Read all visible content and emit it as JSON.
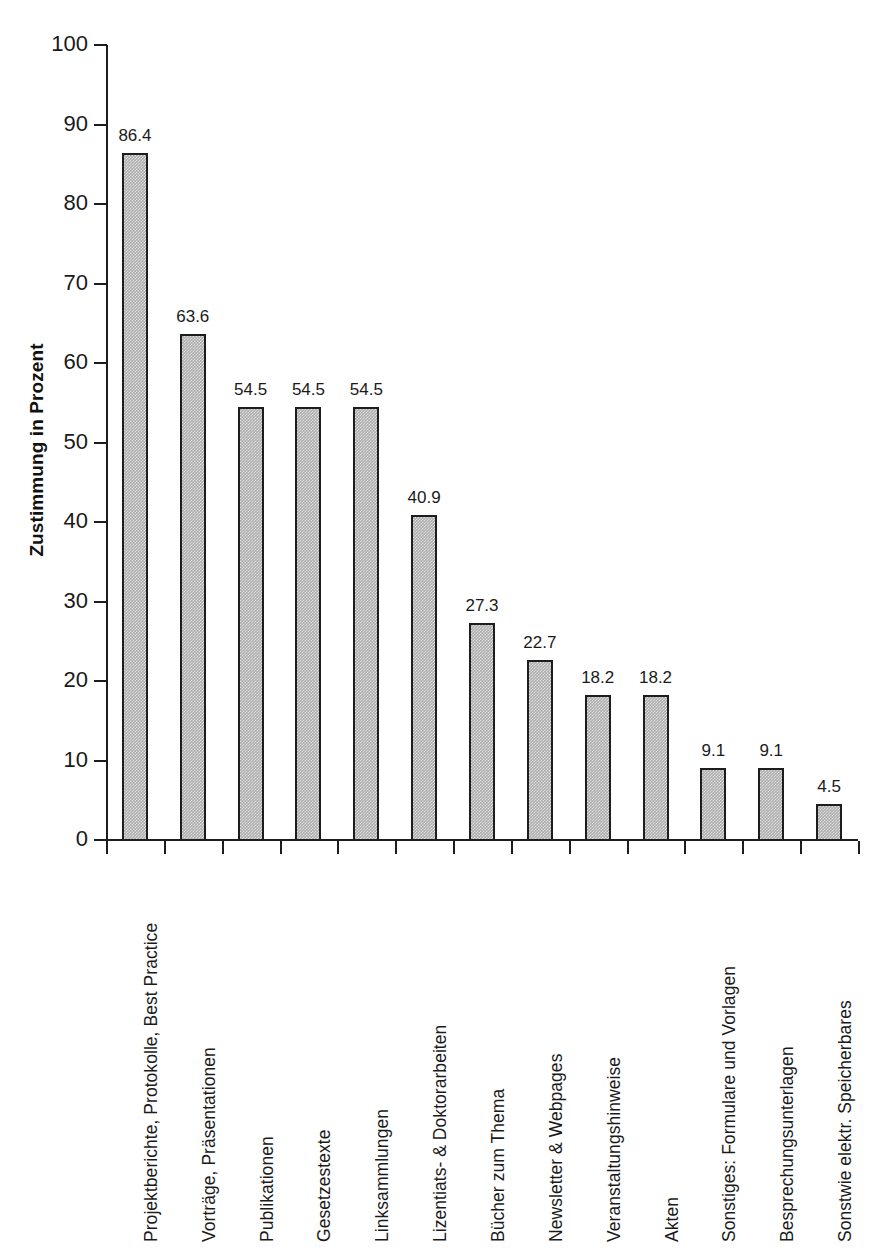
{
  "chart_data": {
    "type": "bar",
    "title": "",
    "subtitle": "",
    "xlabel": "",
    "ylabel": "Zustimmung in Prozent",
    "ylim": [
      0,
      100
    ],
    "ytick_step": 10,
    "yticks": [
      "0",
      "10",
      "20",
      "30",
      "40",
      "50",
      "60",
      "70",
      "80",
      "90",
      "100"
    ],
    "grid": false,
    "legend": false,
    "legend_position": "none",
    "bar_fill_color": "#adadad",
    "bar_border_color": "#1d1d1d",
    "axis_color": "#1d1d1d",
    "value_label_format": "one-decimal",
    "categories": [
      "Projektberichte, Protokolle, Best Practice",
      "Vorträge, Präsentationen",
      "Publikationen",
      "Gesetzestexte",
      "Linksammlungen",
      "Lizentiats- & Doktorarbeiten",
      "Bücher zum Thema",
      "Newsletter & Webpages",
      "Veranstaltungshinweise",
      "Akten",
      "Sonstiges: Formulare und Vorlagen",
      "Besprechungsunterlagen",
      "Sonstwie elektr. Speicherbares"
    ],
    "values": [
      86.4,
      63.6,
      54.5,
      54.5,
      54.5,
      40.9,
      27.3,
      22.7,
      18.2,
      18.2,
      9.1,
      9.1,
      4.5
    ],
    "value_labels": [
      "86.4",
      "63.6",
      "54.5",
      "54.5",
      "54.5",
      "40.9",
      "27.3",
      "22.7",
      "18.2",
      "18.2",
      "9.1",
      "9.1",
      "4.5"
    ]
  }
}
